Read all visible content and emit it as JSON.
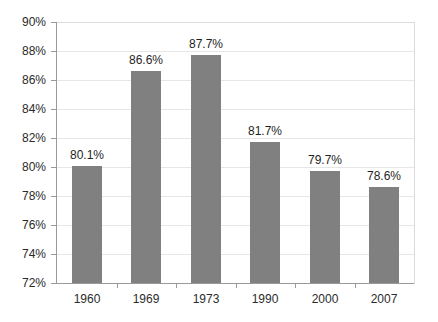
{
  "chart_data": {
    "type": "bar",
    "title": "",
    "subtitle": "",
    "xlabel": "",
    "ylabel": "",
    "categories": [
      "1960",
      "1969",
      "1973",
      "1990",
      "2000",
      "2007"
    ],
    "values": [
      80.1,
      86.6,
      87.7,
      81.7,
      79.7,
      78.6
    ],
    "data_labels": [
      "80.1%",
      "86.6%",
      "87.7%",
      "81.7%",
      "79.7%",
      "78.6%"
    ],
    "ylim": [
      72,
      90
    ],
    "ytick_values": [
      72,
      74,
      76,
      78,
      80,
      82,
      84,
      86,
      88,
      90
    ],
    "ytick_labels": [
      "72%",
      "74%",
      "76%",
      "78%",
      "80%",
      "82%",
      "84%",
      "86%",
      "88%",
      "90%"
    ],
    "grid": true,
    "grid_axis": "y",
    "legend": false,
    "legend_position": "none",
    "bar_color": "#808080",
    "grid_color": "#e6e6e6",
    "axis_color": "#9a9a9a",
    "background_color": "#ffffff",
    "text_color": "#2b2b2b"
  }
}
